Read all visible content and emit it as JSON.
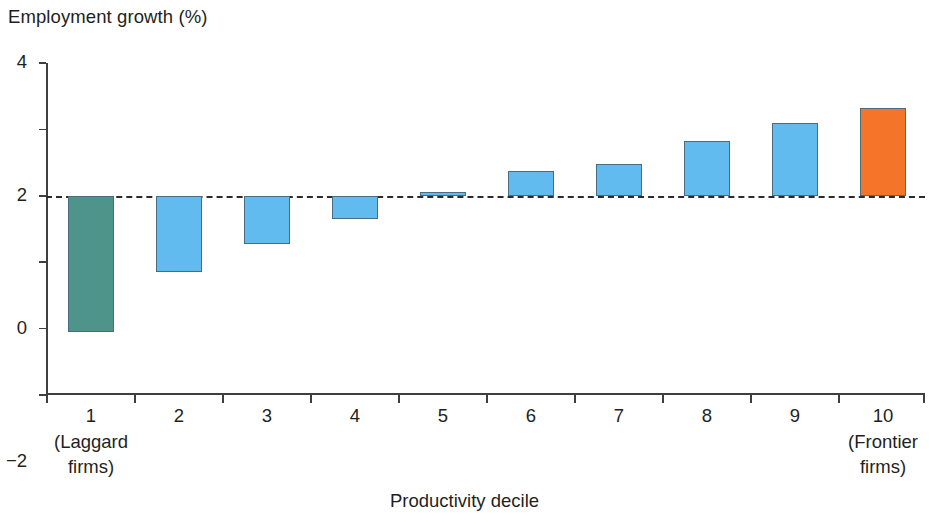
{
  "chart_data": {
    "type": "bar",
    "title": "",
    "ylabel": "Employment growth (%)",
    "xlabel": "Productivity decile",
    "ylim": [
      -6,
      4
    ],
    "yticks": [
      4,
      2,
      0,
      -2,
      -4,
      -6
    ],
    "ytick_labels": [
      "4",
      "2",
      "0",
      "−2",
      "−4",
      "−6"
    ],
    "grid": false,
    "legend": null,
    "zero_line": true,
    "categories": [
      "1",
      "2",
      "3",
      "4",
      "5",
      "6",
      "7",
      "8",
      "9",
      "10"
    ],
    "category_sublabels": [
      "(Laggard\nfirms)",
      "",
      "",
      "",
      "",
      "",
      "",
      "",
      "",
      "(Frontier\nfirms)"
    ],
    "values": [
      -4.1,
      -2.3,
      -1.45,
      -0.7,
      0.1,
      0.75,
      0.95,
      1.65,
      2.2,
      2.65
    ],
    "bar_colors": [
      "#4e948a",
      "#62bbee",
      "#62bbee",
      "#62bbee",
      "#62bbee",
      "#62bbee",
      "#62bbee",
      "#62bbee",
      "#62bbee",
      "#f4752a"
    ]
  },
  "axes": {
    "y_title": "Employment growth (%)",
    "x_title": "Productivity decile",
    "y_tick_labels": [
      "4",
      "2",
      "0",
      "−2",
      "−4",
      "−6"
    ],
    "x_tick_labels": [
      "1",
      "2",
      "3",
      "4",
      "5",
      "6",
      "7",
      "8",
      "9",
      "10"
    ]
  },
  "annotations": {
    "laggard_line1": "(Laggard",
    "laggard_line2": "firms)",
    "frontier_line1": "(Frontier",
    "frontier_line2": "firms)"
  },
  "colors": {
    "laggard": "#4e948a",
    "middle": "#62bbee",
    "frontier": "#f4752a",
    "axis": "#3f3f3f",
    "text": "#231f20",
    "zero_line": "#2b2b2b"
  }
}
